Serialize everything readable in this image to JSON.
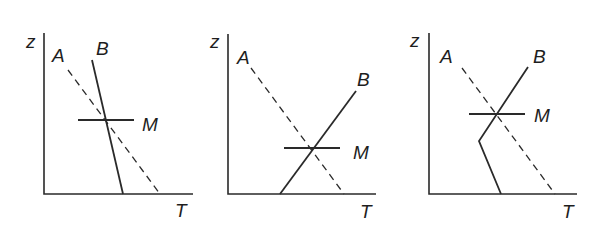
{
  "panels": [
    {
      "id": "panel-1",
      "labels": {
        "z": "z",
        "A": "A",
        "B": "B",
        "M": "M",
        "T": "T"
      },
      "axis": {
        "x0": 44,
        "y_top": 33,
        "y_base": 194,
        "x_end": 193
      },
      "curve_A_dashed": [
        [
          68,
          70
        ],
        [
          160,
          194
        ]
      ],
      "curve_B": [
        [
          92,
          60
        ],
        [
          123,
          194
        ]
      ],
      "level_M": {
        "y": 120,
        "x1": 78,
        "x2": 134
      }
    },
    {
      "id": "panel-2",
      "labels": {
        "z": "z",
        "A": "A",
        "B": "B",
        "M": "M",
        "T": "T"
      },
      "axis": {
        "x0": 228,
        "y_top": 34,
        "y_base": 194,
        "x_end": 376
      },
      "curve_A_dashed": [
        [
          251,
          68
        ],
        [
          344,
          194
        ]
      ],
      "curve_B": [
        [
          280,
          194
        ],
        [
          356,
          91
        ]
      ],
      "level_M": {
        "y": 148,
        "x1": 284,
        "x2": 340
      }
    },
    {
      "id": "panel-3",
      "labels": {
        "z": "z",
        "A": "A",
        "B": "B",
        "M": "M",
        "T": "T"
      },
      "axis": {
        "x0": 429,
        "y_top": 33,
        "y_base": 194,
        "x_end": 577
      },
      "curve_A_dashed": [
        [
          462,
          68
        ],
        [
          555,
          194
        ]
      ],
      "curve_B": [
        [
          501,
          194
        ],
        [
          479,
          141
        ],
        [
          528,
          67
        ]
      ],
      "level_M": {
        "y": 114,
        "x1": 469,
        "x2": 525
      }
    }
  ]
}
